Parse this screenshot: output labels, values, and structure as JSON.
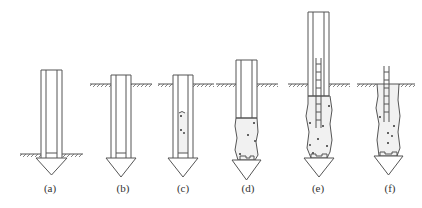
{
  "diagram": {
    "colors": {
      "line": "#555555",
      "concrete": "#f1f1f1",
      "aggregate": "#333333",
      "background": "#ffffff"
    },
    "steps": [
      {
        "id": "a",
        "label": "(a)",
        "x": 50,
        "description": "casing with shoe positioned at ground"
      },
      {
        "id": "b",
        "label": "(b)",
        "x": 123,
        "description": "casing driven into ground"
      },
      {
        "id": "c",
        "label": "(c)",
        "x": 183,
        "description": "concrete poured into casing"
      },
      {
        "id": "d",
        "label": "(d)",
        "x": 248,
        "description": "casing partially withdrawn, concrete bulb formed"
      },
      {
        "id": "e",
        "label": "(e)",
        "x": 318,
        "description": "rebar cage inserted, concrete placed"
      },
      {
        "id": "f",
        "label": "(f)",
        "x": 390,
        "description": "casing removed, pile complete"
      }
    ]
  }
}
